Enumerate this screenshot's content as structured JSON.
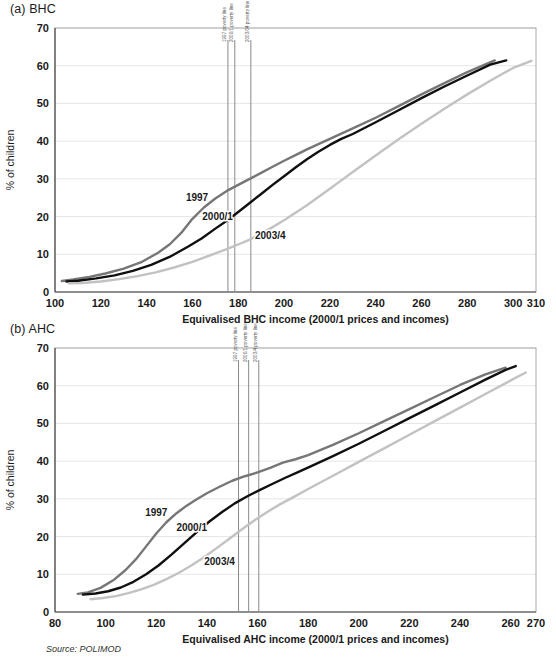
{
  "figure": {
    "source_note": "Source: POLIMOD",
    "colors": {
      "series_1997": "#767676",
      "series_2000_1": "#101010",
      "series_2003_4": "#c2c2c2",
      "poverty_line": "#8a8a8a",
      "grid": "#e6e6e6",
      "frame": "#a9a9a9"
    }
  },
  "panels": [
    {
      "key": "bhc",
      "title": "(a) BHC",
      "chart_data": {
        "type": "line",
        "title": "(a) BHC",
        "xlabel": "Equivalised BHC income (2000/1 prices and incomes)",
        "ylabel": "% of children",
        "xlim": [
          100,
          310
        ],
        "ylim": [
          0,
          70
        ],
        "xticks": [
          100,
          120,
          140,
          160,
          180,
          200,
          220,
          240,
          260,
          280,
          300,
          310
        ],
        "yticks": [
          0,
          10,
          20,
          30,
          40,
          50,
          60,
          70
        ],
        "grid": true,
        "legend_position": "inline-labels",
        "annotations": [
          {
            "label": "1997 poverty line",
            "x": 175.5
          },
          {
            "label": "2000/1 poverty line",
            "x": 178.5
          },
          {
            "label": "2003/04 poverty line",
            "x": 185.5
          }
        ],
        "series": [
          {
            "name": "1997",
            "color": "#767676",
            "label_x": 162,
            "label_y": 24,
            "x": [
              103,
              108,
              115,
              122,
              130,
              138,
              145,
              150,
              155,
              160,
              165,
              170,
              175,
              180,
              185,
              190,
              195,
              200,
              205,
              210,
              215,
              220,
              225,
              230,
              240,
              250,
              260,
              270,
              280,
              292
            ],
            "y": [
              2.9,
              3.3,
              4.0,
              4.9,
              6.2,
              8.0,
              10.4,
              12.6,
              15.6,
              19.4,
              22.4,
              24.8,
              26.8,
              28.4,
              30.0,
              31.6,
              33.2,
              34.8,
              36.3,
              37.8,
              39.2,
              40.6,
              42.0,
              43.4,
              46.2,
              49.3,
              52.4,
              55.4,
              58.3,
              61.4
            ]
          },
          {
            "name": "2000/1",
            "color": "#101010",
            "label_x": 171,
            "label_y": 19,
            "x": [
              105,
              110,
              118,
              126,
              134,
              142,
              150,
              158,
              164,
              170,
              175,
              180,
              185,
              190,
              195,
              200,
              205,
              210,
              215,
              220,
              225,
              230,
              240,
              250,
              260,
              270,
              280,
              290,
              297
            ],
            "y": [
              2.8,
              3.0,
              3.6,
              4.4,
              5.6,
              7.2,
              9.3,
              12.0,
              14.2,
              16.8,
              18.9,
              21.2,
              23.6,
              26.0,
              28.4,
              30.7,
              33.0,
              35.2,
              37.2,
              39.0,
              40.6,
              41.9,
              45.0,
              48.2,
              51.4,
              54.5,
              57.4,
              60.3,
              61.4
            ]
          },
          {
            "name": "2003/4",
            "color": "#c2c2c2",
            "label_x": 194,
            "label_y": 14,
            "x": [
              106,
              112,
              120,
              128,
              136,
              144,
              152,
              160,
              168,
              175,
              180,
              185,
              190,
              195,
              200,
              205,
              210,
              215,
              220,
              225,
              230,
              240,
              250,
              260,
              270,
              280,
              290,
              300,
              308
            ],
            "y": [
              2.3,
              2.4,
              2.8,
              3.4,
              4.2,
              5.2,
              6.5,
              8.0,
              9.8,
              11.4,
              12.6,
              13.9,
              15.5,
              17.2,
              19.0,
              21.0,
              23.0,
              25.2,
              27.4,
              29.6,
              31.8,
              36.2,
              40.5,
              44.6,
              48.6,
              52.4,
              56.0,
              59.4,
              61.3
            ]
          }
        ]
      }
    },
    {
      "key": "ahc",
      "title": "(b) AHC",
      "chart_data": {
        "type": "line",
        "title": "(b) AHC",
        "xlabel": "Equivalised AHC income (2000/1 prices and incomes)",
        "ylabel": "% of children",
        "xlim": [
          80,
          270
        ],
        "ylim": [
          0,
          70
        ],
        "xticks": [
          80,
          100,
          120,
          140,
          160,
          180,
          200,
          220,
          240,
          260,
          270
        ],
        "yticks": [
          0,
          10,
          20,
          30,
          40,
          50,
          60,
          70
        ],
        "grid": true,
        "legend_position": "inline-labels",
        "annotations": [
          {
            "label": "1997 poverty line",
            "x": 152.5
          },
          {
            "label": "2000/1 poverty line",
            "x": 156.5
          },
          {
            "label": "2003/4 poverty line",
            "x": 160.5
          }
        ],
        "series": [
          {
            "name": "1997",
            "color": "#767676",
            "label_x": 120,
            "label_y": 25.5,
            "x": [
              89,
              93,
              98,
              103,
              108,
              112,
              116,
              120,
              124,
              128,
              132,
              136,
              140,
              145,
              150,
              155,
              160,
              165,
              170,
              175,
              180,
              185,
              190,
              200,
              210,
              220,
              230,
              240,
              250,
              258
            ],
            "y": [
              4.8,
              5.2,
              6.4,
              8.4,
              11.2,
              14.0,
              17.4,
              20.8,
              23.8,
              26.2,
              28.2,
              29.9,
              31.5,
              33.2,
              34.8,
              36.0,
              37.0,
              38.2,
              39.6,
              40.5,
              41.6,
              43.0,
              44.4,
              47.4,
              50.6,
              53.8,
              57.0,
              60.2,
              63.0,
              64.8
            ]
          },
          {
            "name": "2000/1",
            "color": "#101010",
            "label_x": 134,
            "label_y": 21.5,
            "x": [
              91,
              96,
              101,
              106,
              111,
              116,
              121,
              126,
              131,
              136,
              141,
              146,
              151,
              156,
              161,
              166,
              171,
              176,
              181,
              190,
              200,
              210,
              220,
              230,
              240,
              250,
              258,
              262
            ],
            "y": [
              4.6,
              4.9,
              5.5,
              6.5,
              8.0,
              10.0,
              12.4,
              15.2,
              18.2,
              21.2,
              24.0,
              26.5,
              28.8,
              30.7,
              32.4,
              34.0,
              35.6,
              37.1,
              38.6,
              41.4,
              44.6,
              48.0,
              51.4,
              54.8,
              58.2,
              61.6,
              64.2,
              65.2
            ]
          },
          {
            "name": "2003/4",
            "color": "#c2c2c2",
            "label_x": 145,
            "label_y": 12.5,
            "x": [
              94,
              99,
              104,
              109,
              114,
              119,
              124,
              129,
              134,
              139,
              144,
              149,
              154,
              159,
              164,
              169,
              174,
              180,
              190,
              200,
              210,
              220,
              230,
              240,
              250,
              260,
              266
            ],
            "y": [
              3.4,
              3.7,
              4.2,
              5.0,
              6.0,
              7.2,
              8.7,
              10.4,
              12.4,
              14.6,
              17.0,
              19.5,
              22.0,
              24.4,
              26.6,
              28.6,
              30.4,
              32.6,
              36.2,
              39.8,
              43.4,
              47.0,
              50.6,
              54.2,
              57.8,
              61.4,
              63.5
            ]
          }
        ]
      }
    }
  ]
}
